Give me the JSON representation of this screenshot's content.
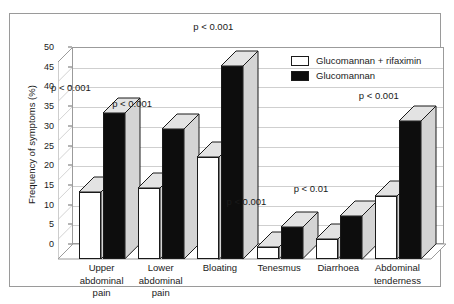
{
  "chart_data": {
    "type": "bar",
    "title": "",
    "xlabel": "",
    "ylabel": "Frequency of symptoms (%)",
    "ylim": [
      0,
      50
    ],
    "ytick_step": 5,
    "yticks": [
      "0",
      "5",
      "10",
      "15",
      "20",
      "25",
      "30",
      "35",
      "40",
      "45",
      "50"
    ],
    "grid": true,
    "legend_position": "top-right",
    "categories": [
      "Upper abdominal pain",
      "Lower abdominal pain",
      "Bloating",
      "Tenesmus",
      "Diarrhoea",
      "Abdominal tenderness"
    ],
    "category_lines": [
      [
        "Upper",
        "abdominal",
        "pain"
      ],
      [
        "Lower",
        "abdominal",
        "pain"
      ],
      [
        "Bloating"
      ],
      [
        "Tenesmus"
      ],
      [
        "Diarrhoea"
      ],
      [
        "Abdominal",
        "tenderness"
      ]
    ],
    "series": [
      {
        "name": "Glucomannan + rifaximin",
        "color": "#ffffff",
        "values": [
          17,
          18,
          26,
          3,
          5,
          16
        ]
      },
      {
        "name": "Glucomannan",
        "color": "#0d0d0d",
        "values": [
          37,
          33,
          49,
          8,
          11,
          35
        ]
      }
    ],
    "annotations": [
      {
        "text": "p < 0.001",
        "category": "Upper abdominal pain"
      },
      {
        "text": "p < 0.001",
        "category": "Lower abdominal pain"
      },
      {
        "text": "p < 0.001",
        "category": "Bloating"
      },
      {
        "text": "p < 0.001",
        "category": "Tenesmus"
      },
      {
        "text": "p < 0.01",
        "category": "Diarrhoea"
      },
      {
        "text": "p < 0.001",
        "category": "Abdominal tenderness"
      }
    ]
  },
  "legend": {
    "items": [
      {
        "label": "Glucomannan + rifaximin",
        "swatch": "white"
      },
      {
        "label": "Glucomannan",
        "swatch": "black"
      }
    ]
  },
  "axis": {
    "y_title": "Frequency of symptoms (%)",
    "y_ticks": [
      "50",
      "45",
      "40",
      "35",
      "30",
      "25",
      "20",
      "15",
      "10",
      "5",
      "0"
    ]
  },
  "pvalues": {
    "upper_abdominal_pain": "p < 0.001",
    "lower_abdominal_pain": "p < 0.001",
    "bloating": "p < 0.001",
    "tenesmus": "p < 0.001",
    "diarrhoea": "p < 0.01",
    "abdominal_tenderness": "p < 0.001"
  }
}
